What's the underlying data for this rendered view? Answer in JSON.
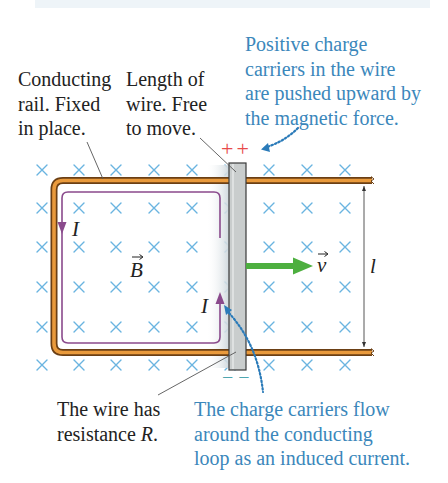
{
  "labels": {
    "conducting_rail": {
      "lines": [
        "Conducting",
        "rail. Fixed",
        "in place."
      ]
    },
    "moving_wire": {
      "lines": [
        "Length of",
        "wire. Free",
        "to move."
      ]
    },
    "positive_carriers": {
      "lines": [
        "Positive charge",
        "carriers in the wire",
        "are pushed upward by",
        "the magnetic force."
      ]
    },
    "wire_resistance": {
      "line1": "The wire has",
      "line2_text": "resistance ",
      "line2_symbol": "R",
      "line2_suffix": "."
    },
    "induced_current": {
      "lines": [
        "The charge carriers flow",
        "around the conducting",
        "loop as an induced current."
      ]
    }
  },
  "symbols": {
    "magnetic_field": "B",
    "velocity": "v",
    "current": "I",
    "length": "l",
    "positive_charges": "++",
    "negative_charges": "− −"
  },
  "colors": {
    "annotation_blue": "#3b87bb",
    "field_marks": "#6ab4e0",
    "rail_fill": "#e99a3c",
    "rail_edge": "#6b3f14",
    "current_loop": "#8a4a8c",
    "velocity_arrow": "#4daf3f",
    "positive_charge": "#e84a4a",
    "negative_charge": "#4fa6b0",
    "wire_fill": "#c9cdcd"
  }
}
